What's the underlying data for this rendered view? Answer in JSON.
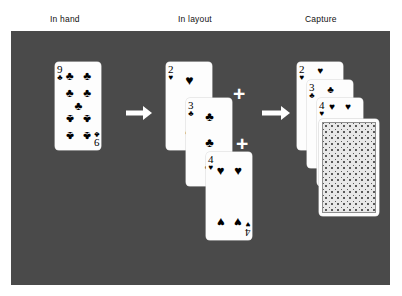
{
  "headers": [
    {
      "label": "In hand",
      "x": 50,
      "y": 14
    },
    {
      "label": "In layout",
      "x": 178,
      "y": 14
    },
    {
      "label": "Capture",
      "x": 305,
      "y": 14
    }
  ],
  "panel": {
    "color": "#4a4a4a"
  },
  "colors": {
    "background": "#ffffff",
    "panel": "#4a4a4a",
    "card_face": "#fdfdfd",
    "card_ink": "#000000",
    "arrow": "#ffffff",
    "plus": "#ffffff",
    "card_back_pattern": "#5a5a5a"
  },
  "in_hand": {
    "cards": [
      {
        "rank": "9",
        "suit": "♣",
        "suit_name": "clubs",
        "x": 55,
        "y": 62,
        "w": 46,
        "h": 88
      }
    ]
  },
  "in_layout": {
    "cards": [
      {
        "rank": "2",
        "suit": "♥",
        "suit_name": "hearts",
        "x": 166,
        "y": 62,
        "w": 46,
        "h": 88
      },
      {
        "rank": "3",
        "suit": "♣",
        "suit_name": "clubs",
        "x": 186,
        "y": 98,
        "w": 46,
        "h": 88
      },
      {
        "rank": "4",
        "suit": "♥",
        "suit_name": "hearts",
        "x": 206,
        "y": 152,
        "w": 46,
        "h": 88
      }
    ],
    "plus_signs": [
      {
        "label": "+",
        "x": 233,
        "y": 83
      },
      {
        "label": "+",
        "x": 236,
        "y": 133
      }
    ]
  },
  "capture": {
    "cards": [
      {
        "rank": "2",
        "suit": "♥",
        "suit_name": "hearts",
        "x": 297,
        "y": 62,
        "w": 46,
        "h": 88
      },
      {
        "rank": "3",
        "suit": "♣",
        "suit_name": "clubs",
        "x": 307,
        "y": 80,
        "w": 46,
        "h": 88
      },
      {
        "rank": "4",
        "suit": "♥",
        "suit_name": "hearts",
        "x": 317,
        "y": 98,
        "w": 46,
        "h": 88
      }
    ],
    "card_back": {
      "x": 319,
      "y": 119,
      "w": 60,
      "h": 97,
      "label": "face-down card"
    }
  },
  "arrows": [
    {
      "x": 126,
      "y": 106,
      "w": 26,
      "h": 14,
      "shaft_w": 18,
      "direction": "right"
    },
    {
      "x": 262,
      "y": 106,
      "w": 28,
      "h": 14,
      "shaft_w": 20,
      "direction": "right"
    }
  ]
}
